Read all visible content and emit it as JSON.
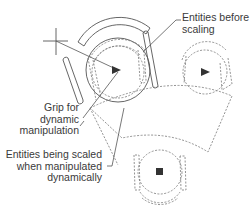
{
  "figure": {
    "type": "CAD dynamic scaling illustration",
    "colors": {
      "line": "#555555",
      "dashed": "#777777",
      "grip": "#333333",
      "text": "#3a3a3a"
    }
  },
  "labels": {
    "before": {
      "line1": "Entities before",
      "line2": "scaling"
    },
    "grip": {
      "line1": "Grip for",
      "line2": "dynamic",
      "line3": "manipulation"
    },
    "scaled": {
      "line1": "Entities being scaled",
      "line2": "when manipulated",
      "line3": "dynamically"
    }
  },
  "icons": {
    "crosshair": "crosshair-cursor-icon",
    "grip_main": "triangle-grip-icon",
    "grip_right": "triangle-grip-icon",
    "grip_bottom": "square-grip-icon"
  }
}
